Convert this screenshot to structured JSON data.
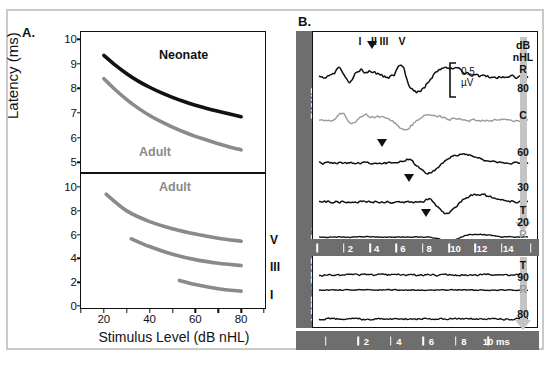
{
  "figure": {
    "background": "#ffffff",
    "frame_color": "#c9c9c9"
  },
  "panelA": {
    "letter": "A.",
    "axis": {
      "ylabel": "Latency (ms)",
      "xlabel": "Stimulus Level (dB nHL)",
      "x_ticks": [
        "20",
        "40",
        "60",
        "80"
      ],
      "x_tick_values": [
        20,
        40,
        60,
        80
      ],
      "xlim": [
        10,
        90
      ],
      "top_y_ticks": [
        "10",
        "9",
        "8",
        "7",
        "6",
        "5"
      ],
      "top_ylim": [
        4.6,
        10.3
      ],
      "bottom_y_ticks": [
        "10",
        "8",
        "6",
        "4",
        "2",
        "0"
      ],
      "bottom_ylim": [
        0,
        11.1
      ]
    },
    "labels": {
      "neonate": "Neonate",
      "adult_top": "Adult",
      "adult_bottom": "Adult",
      "wave_v": "V",
      "wave_iii": "III",
      "wave_i": "I"
    },
    "colors": {
      "neonate_curve": "#111111",
      "adult_curve": "#8a8a8a"
    }
  },
  "panelB": {
    "letter": "B.",
    "side_labels": {
      "right": "RIGHT",
      "left": "LEFT < TEST EAR >"
    },
    "wave_markers": [
      "I",
      "II",
      "III",
      "V"
    ],
    "scale_bar": {
      "value": "0.5",
      "unit": "µV"
    },
    "right_column": {
      "header_line1": "dB",
      "header_line2": "nHL",
      "entries": [
        "R",
        "80",
        "C",
        "60",
        "30",
        "T",
        "20",
        "R",
        "T",
        "90",
        "R",
        "80"
      ]
    },
    "time_axis_top": {
      "ticks": [
        "2",
        "4",
        "6",
        "8",
        "10",
        "12",
        "14"
      ],
      "tick_values": [
        2,
        4,
        6,
        8,
        10,
        12,
        14
      ]
    },
    "time_axis_bottom": {
      "ticks": [
        "2",
        "4",
        "6",
        "8",
        "10 ms"
      ],
      "tick_values": [
        2,
        4,
        6,
        8,
        10
      ]
    },
    "colors": {
      "bar": "#6e6e6e",
      "trace_black": "#111111",
      "trace_gray": "#9a9a9a",
      "arrow": "#c4c4c4"
    }
  },
  "chart_data": [
    {
      "type": "line",
      "title": "Panel A top - ABR wave V latency-intensity function",
      "xlabel": "Stimulus Level (dB nHL)",
      "ylabel": "Latency (ms)",
      "xlim": [
        10,
        90
      ],
      "ylim": [
        4.6,
        10.3
      ],
      "grid": false,
      "legend": "inline-annotations",
      "series": [
        {
          "name": "Neonate",
          "color": "#111111",
          "x": [
            20,
            25,
            30,
            35,
            40,
            45,
            50,
            55,
            60,
            65,
            70,
            75,
            80
          ],
          "y": [
            9.35,
            8.95,
            8.6,
            8.3,
            8.05,
            7.83,
            7.64,
            7.47,
            7.32,
            7.19,
            7.07,
            6.96,
            6.85
          ]
        },
        {
          "name": "Adult",
          "color": "#8a8a8a",
          "x": [
            20,
            25,
            30,
            35,
            40,
            45,
            50,
            55,
            60,
            65,
            70,
            75,
            80
          ],
          "y": [
            8.4,
            7.95,
            7.55,
            7.2,
            6.9,
            6.65,
            6.43,
            6.23,
            6.05,
            5.9,
            5.75,
            5.62,
            5.5
          ]
        }
      ]
    },
    {
      "type": "line",
      "title": "Panel A bottom - Adult ABR waves I, III, V latency-intensity functions",
      "xlabel": "Stimulus Level (dB nHL)",
      "ylabel": "Latency (ms)",
      "xlim": [
        10,
        90
      ],
      "ylim": [
        0,
        11.1
      ],
      "grid": false,
      "legend": "inline-annotations",
      "series": [
        {
          "name": "V",
          "color": "#8a8a8a",
          "x": [
            21,
            30,
            40,
            50,
            60,
            70,
            80
          ],
          "y": [
            9.4,
            8.0,
            7.1,
            6.5,
            6.05,
            5.7,
            5.45
          ]
        },
        {
          "name": "III",
          "color": "#8a8a8a",
          "x": [
            32,
            40,
            50,
            60,
            70,
            80
          ],
          "y": [
            5.65,
            5.0,
            4.35,
            3.9,
            3.6,
            3.4
          ]
        },
        {
          "name": "I",
          "color": "#8a8a8a",
          "x": [
            53,
            60,
            70,
            80
          ],
          "y": [
            2.15,
            1.8,
            1.45,
            1.25
          ]
        }
      ]
    },
    {
      "type": "line",
      "title": "Panel B - ABR waveform recordings by stimulus level",
      "xlabel": "Time (ms)",
      "ylabel": "Amplitude (µV)",
      "traces": [
        {
          "name": "R 80",
          "level": "80",
          "ear": "R",
          "color": "#111111",
          "wave_v_marker_ms": 6.0
        },
        {
          "name": "C",
          "level": "C",
          "ear": "C",
          "color": "#9a9a9a",
          "wave_v_marker_ms": null
        },
        {
          "name": "60",
          "level": "60",
          "ear": "R",
          "color": "#111111",
          "wave_v_marker_ms": 6.5
        },
        {
          "name": "30",
          "level": "30",
          "ear": "R",
          "color": "#111111",
          "wave_v_marker_ms": 8.1
        },
        {
          "name": "T 20 R",
          "level": "20",
          "ear": "R",
          "color": "#111111",
          "wave_v_marker_ms": 9.0
        },
        {
          "name": "T 90 R",
          "level": "90",
          "ear": "L",
          "color": "#111111",
          "wave_v_marker_ms": null
        },
        {
          "name": "80",
          "level": "80",
          "ear": "L",
          "color": "#111111",
          "wave_v_marker_ms": null
        }
      ]
    }
  ]
}
